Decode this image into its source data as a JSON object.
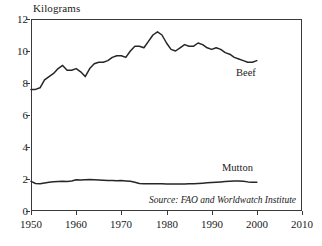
{
  "figure": {
    "y_axis_title": "Kilograms",
    "source_note": "Source: FAO and Worldwatch Institute"
  },
  "chart_data": {
    "type": "line",
    "title": "",
    "subtitle": "",
    "xlabel": "",
    "ylabel": "Kilograms",
    "xlim": [
      1950,
      2010
    ],
    "ylim": [
      0,
      12
    ],
    "xticks": [
      1950,
      1960,
      1970,
      1980,
      1990,
      2000,
      2010
    ],
    "yticks": [
      0,
      2,
      4,
      6,
      8,
      10,
      12
    ],
    "grid": true,
    "grid_axis": "y",
    "legend_position": "inline-labels",
    "annotations": [
      {
        "text": "Beef",
        "x": 1993,
        "y": 8.5
      },
      {
        "text": "Mutton",
        "x": 1989,
        "y": 2.7
      },
      {
        "text": "Source: FAO and Worldwatch Institute",
        "x": 1998,
        "y": 0.45
      }
    ],
    "line_color": "#262626",
    "grid_color": "#b5b5b5",
    "frame_color": "#3a3a3a",
    "x": [
      1950,
      1951,
      1952,
      1953,
      1954,
      1955,
      1956,
      1957,
      1958,
      1959,
      1960,
      1961,
      1962,
      1963,
      1964,
      1965,
      1966,
      1967,
      1968,
      1969,
      1970,
      1971,
      1972,
      1973,
      1974,
      1975,
      1976,
      1977,
      1978,
      1979,
      1980,
      1981,
      1982,
      1983,
      1984,
      1985,
      1986,
      1987,
      1988,
      1989,
      1990,
      1991,
      1992,
      1993,
      1994,
      1995,
      1996,
      1997,
      1998,
      1999,
      2000
    ],
    "series": [
      {
        "name": "Beef",
        "values": [
          7.6,
          7.6,
          7.7,
          8.2,
          8.4,
          8.6,
          8.9,
          9.1,
          8.8,
          8.8,
          8.9,
          8.7,
          8.4,
          8.9,
          9.2,
          9.3,
          9.3,
          9.4,
          9.6,
          9.7,
          9.7,
          9.6,
          10.0,
          10.3,
          10.3,
          10.2,
          10.6,
          11.0,
          11.2,
          11.0,
          10.5,
          10.1,
          10.0,
          10.2,
          10.4,
          10.3,
          10.3,
          10.5,
          10.4,
          10.2,
          10.1,
          10.2,
          10.1,
          9.9,
          9.8,
          9.6,
          9.5,
          9.4,
          9.3,
          9.3,
          9.4
        ]
      },
      {
        "name": "Mutton",
        "values": [
          1.85,
          1.72,
          1.7,
          1.75,
          1.8,
          1.83,
          1.85,
          1.86,
          1.85,
          1.88,
          1.95,
          1.93,
          1.95,
          1.97,
          1.96,
          1.94,
          1.92,
          1.9,
          1.9,
          1.89,
          1.9,
          1.88,
          1.86,
          1.8,
          1.72,
          1.7,
          1.7,
          1.71,
          1.7,
          1.7,
          1.68,
          1.68,
          1.68,
          1.68,
          1.68,
          1.7,
          1.7,
          1.72,
          1.74,
          1.76,
          1.78,
          1.8,
          1.82,
          1.84,
          1.86,
          1.88,
          1.88,
          1.86,
          1.82,
          1.8,
          1.8
        ]
      }
    ]
  }
}
